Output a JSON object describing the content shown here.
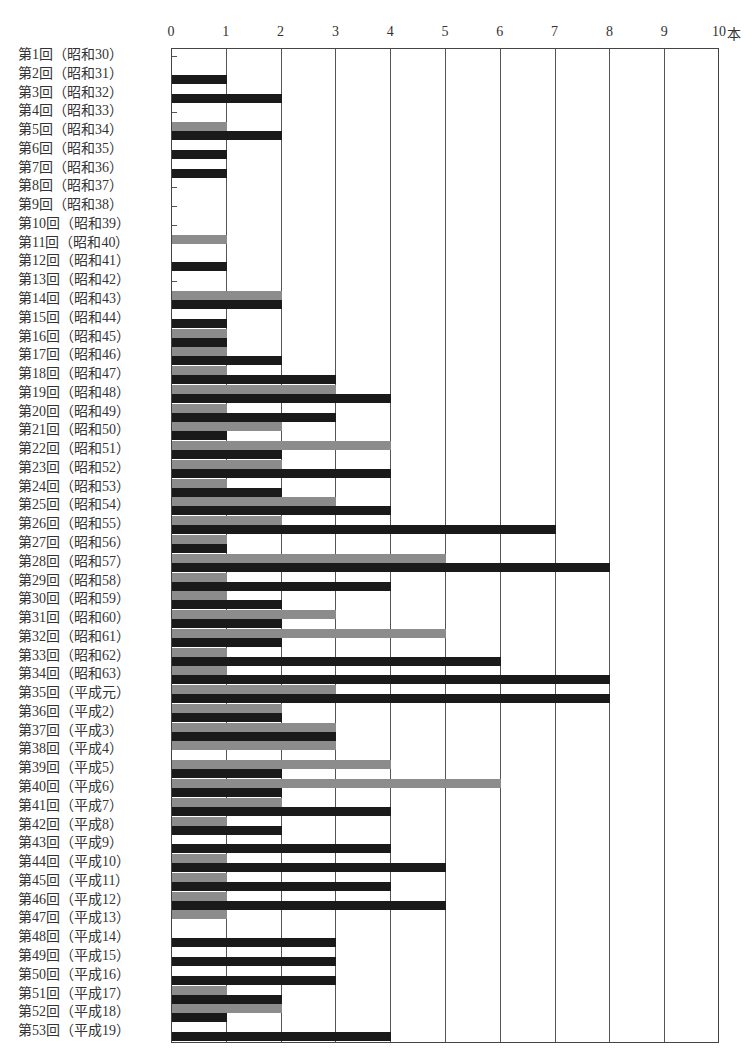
{
  "chart_data": {
    "type": "bar",
    "orientation": "horizontal",
    "title": "",
    "xlabel": "本",
    "ylabel": "",
    "xlim": [
      0,
      10
    ],
    "x_ticks": [
      "0",
      "1",
      "2",
      "3",
      "4",
      "5",
      "6",
      "7",
      "8",
      "9",
      "10"
    ],
    "x_unit": "本",
    "grid": true,
    "legend": null,
    "categories": [
      "第1回（昭和30）",
      "第2回（昭和31）",
      "第3回（昭和32）",
      "第4回（昭和33）",
      "第5回（昭和34）",
      "第6回（昭和35）",
      "第7回（昭和36）",
      "第8回（昭和37）",
      "第9回（昭和38）",
      "第10回（昭和39）",
      "第11回（昭和40）",
      "第12回（昭和41）",
      "第13回（昭和42）",
      "第14回（昭和43）",
      "第15回（昭和44）",
      "第16回（昭和45）",
      "第17回（昭和46）",
      "第18回（昭和47）",
      "第19回（昭和48）",
      "第20回（昭和49）",
      "第21回（昭和50）",
      "第22回（昭和51）",
      "第23回（昭和52）",
      "第24回（昭和53）",
      "第25回（昭和54）",
      "第26回（昭和55）",
      "第27回（昭和56）",
      "第28回（昭和57）",
      "第29回（昭和58）",
      "第30回（昭和59）",
      "第31回（昭和60）",
      "第32回（昭和61）",
      "第33回（昭和62）",
      "第34回（昭和63）",
      "第35回（平成元）",
      "第36回（平成2）",
      "第37回（平成3）",
      "第38回（平成4）",
      "第39回（平成5）",
      "第40回（平成6）",
      "第41回（平成7）",
      "第42回（平成8）",
      "第43回（平成9）",
      "第44回（平成10）",
      "第45回（平成11）",
      "第46回（平成12）",
      "第47回（平成13）",
      "第48回（平成14）",
      "第49回（平成15）",
      "第50回（平成16）",
      "第51回（平成17）",
      "第52回（平成18）",
      "第53回（平成19）"
    ],
    "series": [
      {
        "name": "gray",
        "color": "#8c8c8c",
        "values": [
          0,
          0,
          0,
          0,
          1,
          0,
          0,
          0,
          0,
          0,
          1,
          0,
          0,
          2,
          0,
          1,
          1,
          1,
          3,
          1,
          2,
          4,
          2,
          1,
          3,
          2,
          1,
          5,
          1,
          1,
          3,
          5,
          1,
          1,
          3,
          2,
          3,
          3,
          4,
          6,
          2,
          1,
          0,
          1,
          1,
          1,
          1,
          0,
          0,
          0,
          1,
          2,
          0
        ]
      },
      {
        "name": "black",
        "color": "#1a1a1a",
        "values": [
          0,
          1,
          2,
          0,
          2,
          1,
          1,
          0,
          0,
          0,
          0,
          1,
          0,
          2,
          1,
          1,
          2,
          3,
          4,
          3,
          1,
          2,
          4,
          2,
          4,
          7,
          1,
          8,
          4,
          2,
          2,
          2,
          6,
          8,
          8,
          2,
          3,
          0,
          2,
          2,
          4,
          2,
          4,
          5,
          4,
          5,
          0,
          3,
          3,
          3,
          2,
          1,
          4
        ]
      }
    ]
  }
}
